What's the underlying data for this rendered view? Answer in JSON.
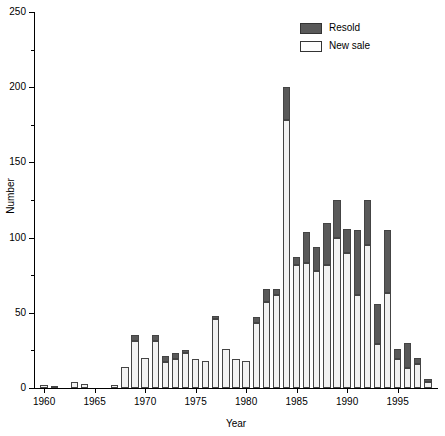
{
  "chart_data": {
    "type": "bar",
    "stacked": true,
    "title": "",
    "xlabel": "Year",
    "ylabel": "Number",
    "ylim": [
      0,
      250
    ],
    "ytick_major": [
      0,
      50,
      100,
      150,
      200,
      250
    ],
    "ytick_minor": [
      25,
      75,
      125,
      175,
      225
    ],
    "xtick_labels": [
      "1960",
      "1965",
      "1970",
      "1975",
      "1980",
      "1985",
      "1990",
      "1995"
    ],
    "xtick_values": [
      1960,
      1965,
      1970,
      1975,
      1980,
      1985,
      1990,
      1995
    ],
    "xlim": [
      1959,
      1999
    ],
    "grid": false,
    "legend_position": "top-right",
    "categories": [
      1960,
      1961,
      1962,
      1963,
      1964,
      1965,
      1966,
      1967,
      1968,
      1969,
      1970,
      1971,
      1972,
      1973,
      1974,
      1975,
      1976,
      1977,
      1978,
      1979,
      1980,
      1981,
      1982,
      1983,
      1984,
      1985,
      1986,
      1987,
      1988,
      1989,
      1990,
      1991,
      1992,
      1993,
      1994,
      1995,
      1996,
      1997,
      1998
    ],
    "series": [
      {
        "name": "New sale",
        "color": "#f2f2f2",
        "values": [
          2,
          1,
          0,
          4,
          3,
          0,
          0,
          2,
          14,
          31,
          20,
          31,
          17,
          19,
          23,
          19,
          18,
          46,
          26,
          19,
          18,
          43,
          57,
          62,
          178,
          82,
          83,
          78,
          82,
          100,
          90,
          62,
          95,
          29,
          63,
          19,
          13,
          16,
          4
        ]
      },
      {
        "name": "Resold",
        "color": "#595959",
        "values": [
          0,
          0,
          0,
          0,
          0,
          0,
          0,
          0,
          0,
          4,
          0,
          4,
          4,
          4,
          2,
          0,
          0,
          2,
          0,
          0,
          0,
          4,
          9,
          4,
          22,
          5,
          21,
          16,
          28,
          25,
          16,
          43,
          30,
          27,
          42,
          7,
          17,
          4,
          2
        ]
      }
    ],
    "totals": [
      2,
      1,
      0,
      4,
      3,
      0,
      0,
      2,
      14,
      35,
      20,
      35,
      21,
      23,
      25,
      19,
      18,
      48,
      26,
      19,
      18,
      47,
      66,
      66,
      200,
      87,
      104,
      94,
      110,
      125,
      106,
      105,
      125,
      56,
      105,
      26,
      30,
      20,
      6
    ]
  },
  "legend": {
    "items": [
      {
        "label": "Resold",
        "swatch": "resold-swatch"
      },
      {
        "label": "New sale",
        "swatch": "new-sale-swatch"
      }
    ]
  },
  "axes": {
    "y_title": "Number",
    "x_title": "Year"
  }
}
